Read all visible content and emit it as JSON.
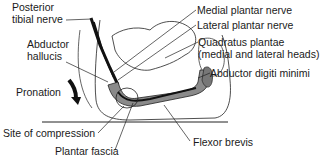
{
  "figure": {
    "labels": {
      "posterior_tibial_nerve": [
        "Posterior",
        "tibial nerve"
      ],
      "abductor_hallucis": [
        "Abductor",
        "hallucis"
      ],
      "pronation": "Pronation",
      "site_of_compression": "Site of compression",
      "plantar_fascia": "Plantar fascia",
      "medial_plantar_nerve": "Medial plantar nerve",
      "lateral_plantar_nerve": "Lateral plantar nerve",
      "quadratus_plantae": [
        "Quadratus plantae",
        "(medial and lateral heads)"
      ],
      "abductor_digiti_minimi": "Abductor digiti minimi",
      "flexor_brevis": "Flexor brevis"
    },
    "icons": {
      "pronation_arrow": "curved-arrow-down-icon"
    },
    "colors": {
      "line": "#1a1a1a",
      "muscle_fill": "#8a8a8a",
      "nerve": "#111111",
      "background": "#ffffff"
    }
  }
}
